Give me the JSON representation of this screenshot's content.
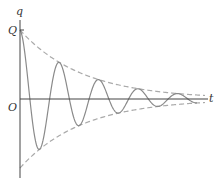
{
  "diagram": {
    "type": "damped-oscillation",
    "labels": {
      "y_axis": "q",
      "x_axis": "t",
      "origin": "O",
      "initial_value": "Q"
    },
    "colors": {
      "axis": "#444444",
      "curve": "#8a8a8a",
      "envelope": "#aaaaaa"
    }
  },
  "chart_data": {
    "type": "line",
    "title": "",
    "xlabel": "t",
    "ylabel": "q",
    "series": [
      {
        "name": "q(t)",
        "style": "solid",
        "description": "Q·e^(-bt)·cos(ωt), ~5 visible cycles"
      },
      {
        "name": "upper envelope",
        "style": "dashed",
        "description": "+Q·e^(-bt)"
      },
      {
        "name": "lower envelope",
        "style": "dashed",
        "description": "-Q·e^(-bt)"
      }
    ],
    "initial_value_label": "Q"
  }
}
